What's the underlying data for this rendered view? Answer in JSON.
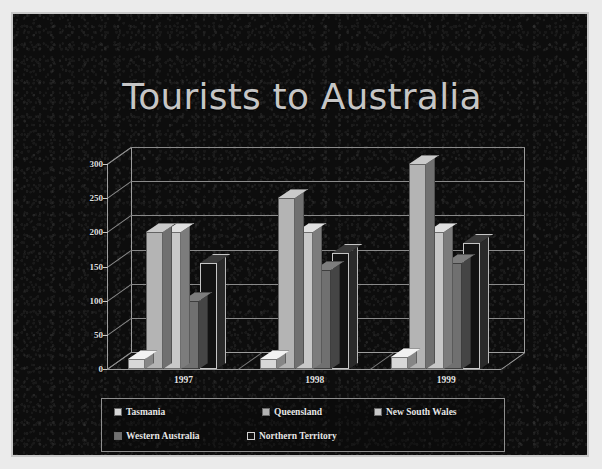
{
  "slide": {
    "title": "Tourists to Australia",
    "background_color": "#0d0d0d",
    "border_color": "#c9c9c9",
    "title_color": "#c6c6c6"
  },
  "chart_data": {
    "type": "bar",
    "title": "Tourists to Australia",
    "xlabel": "",
    "ylabel": "",
    "categories": [
      "1997",
      "1998",
      "1999"
    ],
    "yticks": [
      "0",
      "50",
      "100",
      "150",
      "200",
      "250",
      "300"
    ],
    "ylim": [
      0,
      300
    ],
    "grid": true,
    "legend_position": "bottom",
    "three_d": true,
    "series": [
      {
        "name": "Tasmania",
        "color": "#d8d8d8",
        "values": [
          15,
          15,
          18
        ]
      },
      {
        "name": "Queensland",
        "color": "#b4b4b4",
        "values": [
          200,
          250,
          300
        ]
      },
      {
        "name": "New South Wales",
        "color": "#c8c8c8",
        "values": [
          200,
          200,
          200
        ]
      },
      {
        "name": "Western Australia",
        "color": "#707070",
        "values": [
          100,
          145,
          155
        ]
      },
      {
        "name": "Northern Territory",
        "color": "#121212",
        "values": [
          155,
          170,
          185
        ]
      }
    ]
  },
  "legend": {
    "items": [
      {
        "label": "Tasmania",
        "color": "#d8d8d8"
      },
      {
        "label": "Queensland",
        "color": "#b4b4b4"
      },
      {
        "label": "New South Wales",
        "color": "#c8c8c8"
      },
      {
        "label": "Western Australia",
        "color": "#707070"
      },
      {
        "label": "Northern Territory",
        "color": "#121212"
      }
    ]
  }
}
